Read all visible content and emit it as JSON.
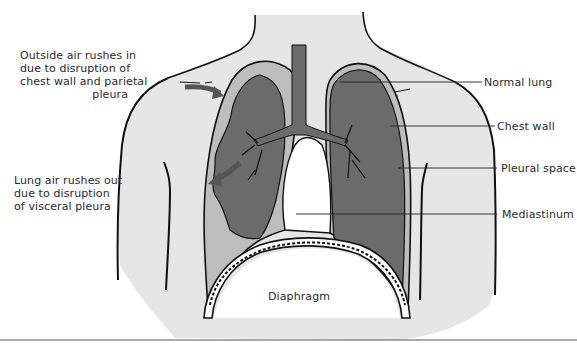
{
  "diagram": {
    "colors": {
      "body": "#e6e6e6",
      "pleural_space": "#bdbdbd",
      "lung": "#6b6b6b",
      "outline": "#111111",
      "arrow": "#555555"
    },
    "annotations_left": [
      {
        "id": "outside-air",
        "lines": [
          "Outside air rushes in",
          "due to disruption of",
          "chest wall and parietal",
          "pleura"
        ]
      },
      {
        "id": "lung-air",
        "lines": [
          "Lung air rushes out",
          "due to disruption",
          "of visceral pleura"
        ]
      }
    ],
    "labels_right": [
      {
        "id": "normal-lung",
        "text": "Normal lung"
      },
      {
        "id": "chest-wall",
        "text": "Chest wall"
      },
      {
        "id": "pleural-space",
        "text": "Pleural space"
      },
      {
        "id": "mediastinum",
        "text": "Mediastinum"
      }
    ],
    "label_center": {
      "id": "diaphragm",
      "text": "Diaphragm"
    }
  }
}
